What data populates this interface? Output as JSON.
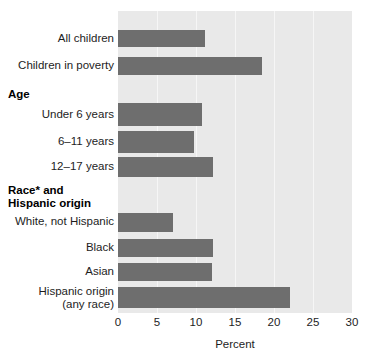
{
  "chart_data": {
    "type": "bar",
    "orientation": "horizontal",
    "title": "",
    "xlabel": "Percent",
    "ylabel": "",
    "xlim": [
      0,
      30
    ],
    "xticks": [
      0,
      5,
      10,
      15,
      20,
      25,
      30
    ],
    "xtick_labels": [
      "0",
      "5",
      "10",
      "15",
      "20",
      "25",
      "30"
    ],
    "grid": true,
    "grid_axis": "x",
    "legend": false,
    "bar_color": "#6e6e6e",
    "plot_background": "#e9e9e9",
    "categories": [
      "All children",
      "Children in poverty",
      "Under 6 years",
      "6–11 years",
      "12–17 years",
      "White, not Hispanic",
      "Black",
      "Asian",
      "Hispanic origin\n(any race)"
    ],
    "values": [
      11.1,
      18.5,
      10.8,
      9.7,
      12.2,
      7.1,
      12.2,
      12.0,
      22.0
    ],
    "group_headers": [
      {
        "label": "Age",
        "before_category": "Under 6 years"
      },
      {
        "label": "Race* and\nHispanic origin",
        "before_category": "White, not Hispanic"
      }
    ],
    "rows": [
      {
        "label": "All children",
        "value": 11.1,
        "top": 30,
        "height": 17
      },
      {
        "label": "Children in poverty",
        "value": 18.5,
        "top": 57,
        "height": 18
      },
      {
        "label": "Under 6 years",
        "value": 10.8,
        "top": 103,
        "height": 23
      },
      {
        "label": "6–11 years",
        "value": 9.7,
        "top": 131,
        "height": 22
      },
      {
        "label": "12–17 years",
        "value": 12.2,
        "top": 157,
        "height": 20
      },
      {
        "label": "White, not Hispanic",
        "value": 7.1,
        "top": 213,
        "height": 19
      },
      {
        "label": "Black",
        "value": 12.2,
        "top": 239,
        "height": 18
      },
      {
        "label": "Asian",
        "value": 12.0,
        "top": 263,
        "height": 18
      },
      {
        "label": "Hispanic origin\n(any race)",
        "value": 22.0,
        "top": 287,
        "height": 21
      }
    ]
  },
  "labels": {
    "row_0": "All children",
    "row_1": "Children in poverty",
    "group_age": "Age",
    "row_2": "Under 6 years",
    "row_3": "6–11 years",
    "row_4": "12–17 years",
    "group_race": "Race* and\nHispanic origin",
    "row_5": "White, not Hispanic",
    "row_6": "Black",
    "row_7": "Asian",
    "row_8": "Hispanic origin\n(any race)"
  },
  "axis": {
    "title": "Percent",
    "ticks": [
      "0",
      "5",
      "10",
      "15",
      "20",
      "25",
      "30"
    ]
  }
}
